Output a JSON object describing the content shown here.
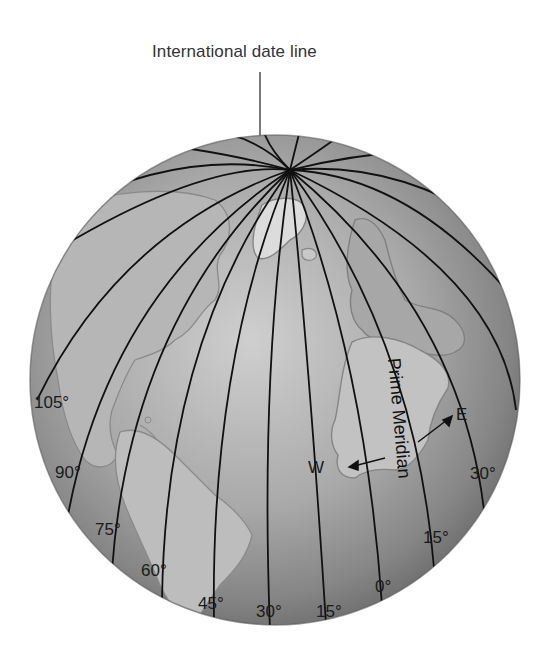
{
  "diagram": {
    "title": "International date line",
    "prime_meridian_label": "Prime Meridian",
    "direction_labels": {
      "west": "W",
      "east": "E"
    },
    "meridian_labels_west": [
      "105°",
      "90°",
      "75°",
      "60°",
      "45°",
      "30°",
      "15°"
    ],
    "meridian_labels_east": [
      "0°",
      "15°",
      "30°"
    ],
    "colors": {
      "globe_light": "#c8c8c8",
      "globe_dark": "#6e6e6e",
      "land": "#b4b4b4",
      "land_outline": "#7a7a7a",
      "meridian": "#111111"
    }
  }
}
